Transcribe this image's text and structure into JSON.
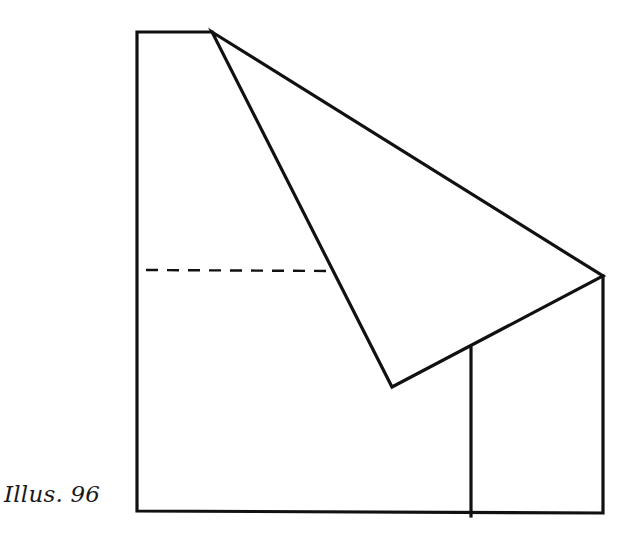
{
  "caption": "Illus. 96",
  "diagram": {
    "type": "paper-fold-illustration",
    "stroke_color": "#111111",
    "background": "#ffffff",
    "outline": [
      [
        137,
        32
      ],
      [
        212,
        32
      ],
      [
        603,
        276
      ],
      [
        603,
        513
      ],
      [
        137,
        511
      ]
    ],
    "folded_flap": [
      [
        212,
        32
      ],
      [
        603,
        276
      ],
      [
        392,
        387
      ]
    ],
    "vertical_line": [
      [
        471,
        348
      ],
      [
        471,
        516
      ]
    ],
    "dashed_line": [
      [
        146,
        270
      ],
      [
        332,
        271
      ]
    ]
  }
}
